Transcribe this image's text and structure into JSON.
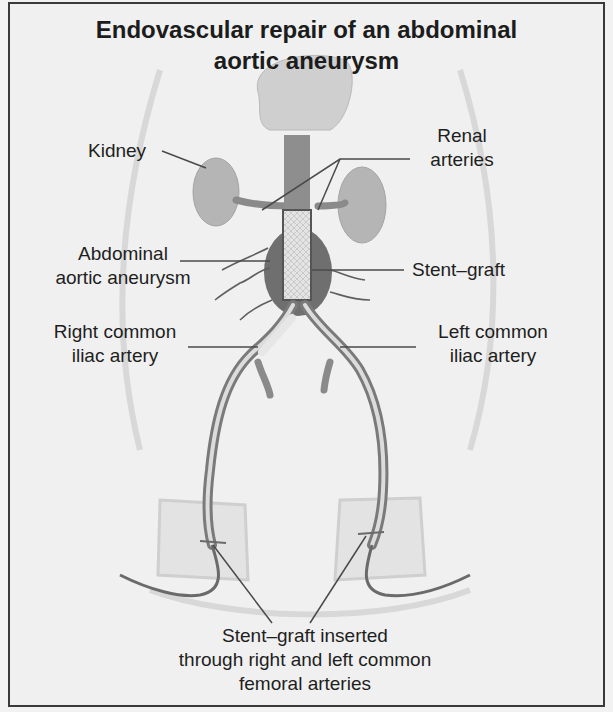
{
  "title": {
    "line1": "Endovascular repair of an abdominal",
    "line2": "aortic aneurysm"
  },
  "labels": {
    "kidney": "Kidney",
    "renal_arteries": {
      "line1": "Renal",
      "line2": "arteries"
    },
    "abdominal_aortic_aneurysm": {
      "line1": "Abdominal",
      "line2": "aortic aneurysm"
    },
    "stent_graft": "Stent–graft",
    "right_common_iliac": {
      "line1": "Right common",
      "line2": "iliac artery"
    },
    "left_common_iliac": {
      "line1": "Left common",
      "line2": "iliac artery"
    },
    "insertion": {
      "line1": "Stent–graft inserted",
      "line2": "through right and left common",
      "line3": "femoral arteries"
    }
  },
  "colors": {
    "background": "#f0f0f0",
    "frame": "#3a3a3a",
    "text": "#1e1e1e",
    "leader_line": "#4a4a4a",
    "vessel": "#7a7a7a",
    "aneurysm": "#6e6e6e",
    "kidney": "#b0b0b0",
    "stent": "#e2e2e2"
  }
}
